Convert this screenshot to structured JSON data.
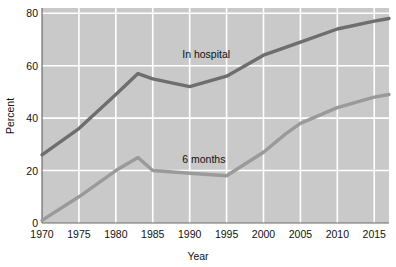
{
  "chart_data": {
    "type": "line",
    "title": "",
    "xlabel": "Year",
    "ylabel": "Percent",
    "xlim": [
      1970,
      2017
    ],
    "ylim": [
      0,
      82
    ],
    "xticks": [
      1970,
      1975,
      1980,
      1985,
      1990,
      1995,
      2000,
      2005,
      2010,
      2015
    ],
    "xtick_labels": [
      "1970",
      "1975",
      "1980",
      "1985",
      "1990",
      "1995",
      "2000",
      "2005",
      "2010",
      "2015"
    ],
    "yticks": [
      0,
      20,
      40,
      60,
      80
    ],
    "ytick_labels": [
      "0",
      "20",
      "40",
      "60",
      "80"
    ],
    "grid": true,
    "grid_color": "#ffffff",
    "plot_background": "#c9c9c9",
    "legend_position": "inline-labels",
    "series": [
      {
        "name": "In hospital",
        "color": "#6e6e6e",
        "label_x": 1989,
        "label_y": 63,
        "x": [
          1970,
          1975,
          1980,
          1983,
          1985,
          1990,
          1995,
          2000,
          2003,
          2005,
          2010,
          2015,
          2017
        ],
        "values": [
          26,
          36,
          49,
          57,
          55,
          52,
          56,
          64,
          67,
          69,
          74,
          77,
          78
        ]
      },
      {
        "name": "6 months",
        "color": "#9a9a9a",
        "label_x": 1989,
        "label_y": 23,
        "x": [
          1970,
          1975,
          1980,
          1983,
          1985,
          1990,
          1995,
          2000,
          2003,
          2005,
          2010,
          2015,
          2017
        ],
        "values": [
          1,
          10,
          20,
          25,
          20,
          19,
          18,
          27,
          34,
          38,
          44,
          48,
          49
        ]
      }
    ]
  },
  "axes": {
    "y_title": "Percent",
    "x_title": "Year"
  }
}
